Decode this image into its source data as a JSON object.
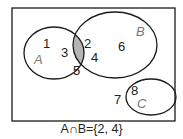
{
  "diagram": {
    "type": "venn",
    "universe": [
      1,
      2,
      3,
      4,
      5,
      6,
      7,
      8
    ],
    "sets": [
      {
        "name": "A",
        "label": "A",
        "elements": [
          1,
          2,
          3,
          4,
          5
        ]
      },
      {
        "name": "B",
        "label": "B",
        "elements": [
          2,
          4,
          6
        ]
      },
      {
        "name": "C",
        "label": "C",
        "elements": [
          7,
          8
        ]
      }
    ],
    "shaded_region": "A∩B",
    "numbers": {
      "n1": "1",
      "n2": "2",
      "n3": "3",
      "n4": "4",
      "n5": "5",
      "n6": "6",
      "n7": "7",
      "n8": "8"
    },
    "labels": {
      "a": "A",
      "b": "B",
      "c": "C"
    },
    "caption": "A∩B={2, 4}",
    "colors": {
      "shade": "#b5b5b5",
      "stroke": "#1a1a1a",
      "label": "#777777"
    }
  }
}
